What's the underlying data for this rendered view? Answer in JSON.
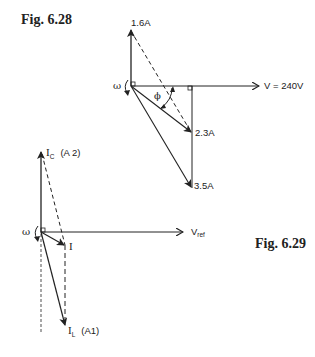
{
  "figures": [
    {
      "id": "fig_6_28",
      "caption": "Fig. 6.28",
      "omega_label": "ω",
      "phi_label": "ϕ",
      "reference_label": "V = 240V",
      "phasors": [
        {
          "name": "capacitive",
          "label": "1.6A"
        },
        {
          "name": "resultant",
          "label": "2.3A"
        },
        {
          "name": "inductive",
          "label": "3.5A"
        }
      ]
    },
    {
      "id": "fig_6_29",
      "caption": "Fig. 6.29",
      "omega_label": "ω",
      "reference_label": "V",
      "reference_sub": "ref",
      "ic_label": "I",
      "ic_sub": "C",
      "ic_meter": "(A 2)",
      "i_label": "I",
      "il_label": "I",
      "il_sub": "L",
      "il_meter": "(A1)"
    }
  ],
  "colors": {
    "ink": "#222222",
    "background": "#ffffff"
  }
}
